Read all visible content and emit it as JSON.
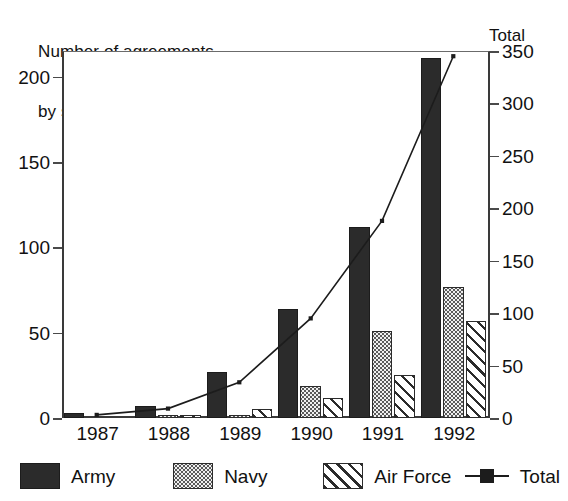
{
  "chart_data": {
    "type": "bar",
    "title": "Number of agreements by service",
    "title_lines": [
      "Number of agreements",
      "by service"
    ],
    "right_axis_title": "Total",
    "xlabel": "",
    "ylabel": "",
    "grid": false,
    "legend_position": "bottom",
    "categories": [
      "1987",
      "1988",
      "1989",
      "1990",
      "1991",
      "1992"
    ],
    "ylim": [
      0,
      215
    ],
    "yticks": [
      0,
      50,
      100,
      150,
      200
    ],
    "y2lim": [
      0,
      350
    ],
    "y2ticks": [
      0,
      50,
      100,
      150,
      200,
      250,
      300,
      350
    ],
    "series": [
      {
        "name": "Army",
        "type": "bar",
        "axis": "left",
        "values": [
          3,
          7,
          27,
          64,
          112,
          211
        ],
        "fill": "solid-black",
        "color": "#2b2b2b"
      },
      {
        "name": "Navy",
        "type": "bar",
        "axis": "left",
        "values": [
          0,
          1,
          2,
          19,
          51,
          77
        ],
        "fill": "dotted",
        "color": "#f0f0f0"
      },
      {
        "name": "Air Force",
        "type": "bar",
        "axis": "left",
        "values": [
          0,
          1,
          5,
          12,
          25,
          57
        ],
        "fill": "diagonal-hatch",
        "color": "#ffffff"
      },
      {
        "name": "Total",
        "type": "line",
        "axis": "right",
        "values": [
          3,
          9,
          34,
          95,
          188,
          345
        ],
        "marker": "square",
        "color": "#1c1c1c"
      }
    ]
  },
  "axes": {
    "left_ticks": [
      "0",
      "50",
      "100",
      "150",
      "200"
    ],
    "right_ticks": [
      "0",
      "50",
      "100",
      "150",
      "200",
      "250",
      "300",
      "350"
    ],
    "x_ticks": [
      "1987",
      "1988",
      "1989",
      "1990",
      "1991",
      "1992"
    ]
  },
  "legend": {
    "items": [
      {
        "label": "Army",
        "style": "army"
      },
      {
        "label": "Navy",
        "style": "navy"
      },
      {
        "label": "Air Force",
        "style": "airforce"
      },
      {
        "label": "Total",
        "style": "total"
      }
    ]
  },
  "colors": {
    "army": "#2b2b2b",
    "navy": "#f0f0f0",
    "airforce": "#ffffff",
    "total_line": "#1c1c1c",
    "axis": "#3a3a3a",
    "background": "#ffffff"
  }
}
